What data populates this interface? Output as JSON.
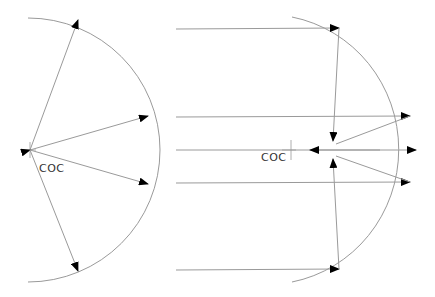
{
  "diagram": {
    "left": {
      "title": "Spherical mirror - rays from center of curvature",
      "coc_label": "COC",
      "center": [
        30,
        150
      ],
      "radius": 120,
      "arc_color": "#9a9a9a",
      "ray_color": "#9a9a9a",
      "arrow_color": "#000000",
      "rays": [
        {
          "to": [
            78,
            19
          ],
          "arrow_at": "end"
        },
        {
          "to": [
            148,
            116
          ],
          "arrow_at": "both"
        },
        {
          "to": [
            148,
            184
          ],
          "arrow_at": "end"
        },
        {
          "to": [
            78,
            271
          ],
          "arrow_at": "end"
        }
      ]
    },
    "right": {
      "title": "Spherical mirror - parallel rays focusing",
      "coc_label": "COC",
      "coc_cross": [
        291,
        152
      ],
      "focus": [
        333,
        150
      ],
      "arc_color": "#9a9a9a",
      "ray_color": "#9a9a9a",
      "arrow_color": "#000000",
      "incoming_rays_y": [
        29,
        117,
        150,
        183,
        270
      ],
      "ray_start_x": 176
    }
  }
}
